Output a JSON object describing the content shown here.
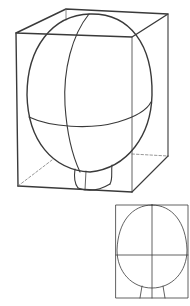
{
  "figure": {
    "title": "",
    "colors": {
      "line": "#3a3a3a",
      "light_line": "#6a6a6a",
      "background": "#ffffff"
    }
  },
  "main_drawing": {
    "box": {
      "front_top_left": [
        16,
        33
      ],
      "front_top_right": [
        132,
        37
      ],
      "back_top_left": [
        66,
        9
      ],
      "back_top_right": [
        168,
        14
      ],
      "front_bottom_left": [
        18,
        186
      ],
      "front_bottom_right": [
        132,
        192
      ],
      "back_bottom_right": [
        168,
        156
      ],
      "back_bottom_left_hidden": [
        52,
        160
      ]
    },
    "head_ovoid": {
      "cx": 90,
      "cy": 93,
      "rx": 63,
      "ry": 79
    },
    "neck": {
      "left_x": 74,
      "right_x": 113,
      "top_y": 168,
      "bottom_y": 190
    }
  },
  "inset_drawing": {
    "box": {
      "x": 116,
      "y": 205,
      "width": 72,
      "height": 93
    },
    "ellipse": {
      "cx": 152,
      "cy": 247,
      "rx": 35,
      "ry": 42
    },
    "center_vertical_x": 152,
    "horizontal_y": 255
  }
}
